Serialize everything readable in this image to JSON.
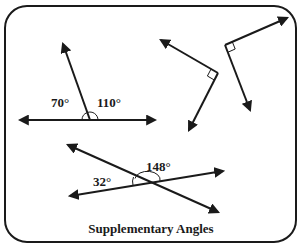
{
  "title": "Supplementary Angles",
  "colors": {
    "stroke": "#1a1a1a",
    "background": "#ffffff"
  },
  "figures": [
    {
      "name": "linear-pair",
      "labels": {
        "left_angle": "70°",
        "right_angle": "110°"
      }
    },
    {
      "name": "perpendicular-pair-1",
      "right_angle_marker": true
    },
    {
      "name": "perpendicular-pair-2",
      "right_angle_marker": true
    },
    {
      "name": "intersecting-lines",
      "labels": {
        "left_angle": "32°",
        "top_angle": "148°"
      }
    }
  ]
}
